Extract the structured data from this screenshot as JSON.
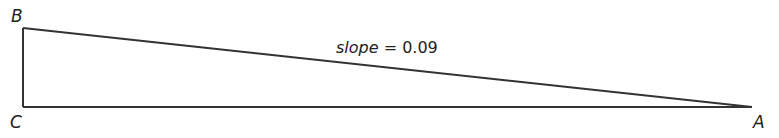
{
  "diagram": {
    "type": "right-triangle",
    "vertices": {
      "B": {
        "label": "B",
        "x": 23,
        "y": 28
      },
      "C": {
        "label": "C",
        "x": 23,
        "y": 107
      },
      "A": {
        "label": "A",
        "x": 752,
        "y": 107
      }
    },
    "slope_label": {
      "variable": "slope",
      "operator": " = ",
      "value": "0.09"
    },
    "stroke_color": "#333333",
    "stroke_width": 2,
    "note": "Labeled slope (0.09) is printed text; drawn line rise/run is ~0.108 (79/729), figure is schematic / not to scale."
  }
}
